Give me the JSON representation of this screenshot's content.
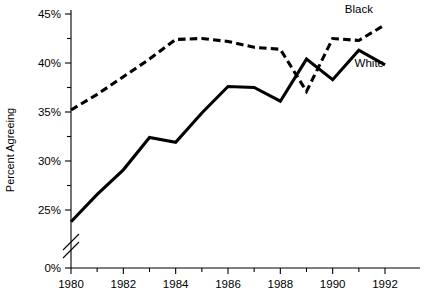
{
  "chart_data": {
    "type": "line",
    "title": "",
    "xlabel": "",
    "ylabel": "Percent Agreeing",
    "x": [
      1980,
      1981,
      1982,
      1983,
      1984,
      1985,
      1986,
      1987,
      1988,
      1989,
      1990,
      1991,
      1992
    ],
    "xlim": [
      1979.6,
      1992.4
    ],
    "ylim": [
      0,
      45
    ],
    "y_axis_break": true,
    "y_axis_break_note": "axis broken between 0% and ~23%",
    "ytick_labels": [
      "0%",
      "25%",
      "30%",
      "35%",
      "40%",
      "45%"
    ],
    "ytick_values": [
      0,
      25,
      30,
      35,
      40,
      45
    ],
    "yminor_values": [
      27.5,
      32.5,
      37.5,
      42.5
    ],
    "xtick_labels": [
      "1980",
      "1982",
      "1984",
      "1986",
      "1988",
      "1990",
      "1992"
    ],
    "xtick_values": [
      1980,
      1982,
      1984,
      1986,
      1988,
      1990,
      1992
    ],
    "xminor_values": [
      1981,
      1983,
      1985,
      1987,
      1989,
      1991
    ],
    "grid": false,
    "legend_position": "inline-right",
    "series": [
      {
        "name": "Black",
        "style": "dashed",
        "color": "#000000",
        "label_text": "Black",
        "values": [
          35.2,
          36.8,
          38.6,
          40.4,
          42.4,
          42.5,
          42.2,
          41.6,
          41.4,
          37.1,
          42.5,
          42.3,
          43.9
        ]
      },
      {
        "name": "White",
        "style": "solid",
        "color": "#000000",
        "label_text": "White",
        "values": [
          23.8,
          26.6,
          29.1,
          32.4,
          31.9,
          34.9,
          37.6,
          37.5,
          36.1,
          40.4,
          38.3,
          41.3,
          39.8
        ]
      }
    ],
    "annotations": [
      {
        "text": "Black",
        "x": 1991.0,
        "y": 45.1
      },
      {
        "text": "White",
        "x": 1991.4,
        "y": 39.6
      }
    ]
  }
}
